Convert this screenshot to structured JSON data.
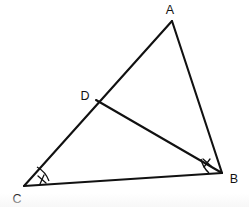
{
  "figure": {
    "kind": "geometry-diagram",
    "background_color": "#ffffff",
    "stroke_color": "#111111",
    "stroke_width": 2.1,
    "width": 249,
    "height": 207
  },
  "points": {
    "A": {
      "name": "A",
      "x": 172,
      "y": 21,
      "label_x": 170,
      "label_y": 12
    },
    "B": {
      "name": "B",
      "x": 222,
      "y": 173,
      "label_x": 231,
      "label_y": 181
    },
    "C": {
      "name": "C",
      "x": 24,
      "y": 186,
      "label_x": 15,
      "label_y": 201
    },
    "D": {
      "name": "D",
      "x": 96,
      "y": 100,
      "label_x": 82,
      "label_y": 98
    }
  },
  "segments": [
    {
      "name": "side-AC",
      "from": "A",
      "to": "C"
    },
    {
      "name": "side-AB",
      "from": "A",
      "to": "B"
    },
    {
      "name": "side-CB",
      "from": "C",
      "to": "B"
    },
    {
      "name": "cevian-DB",
      "from": "D",
      "to": "B"
    }
  ],
  "angle_marks": [
    {
      "name": "angle-C",
      "vertex": "C",
      "arc_path": "M 47 180 A 24 24 0 0 0 36 168",
      "tick_path": "M 38 175 L 45 182",
      "marks": 1
    },
    {
      "name": "angle-DBC",
      "vertex": "B",
      "arc_path": "M 203 160 A 24 24 0 0 0 210 172",
      "tick_path": "M 205 161 L 212 168",
      "marks": 1
    }
  ],
  "labels": {
    "A": "A",
    "B": "B",
    "C": "C",
    "D": "D"
  }
}
